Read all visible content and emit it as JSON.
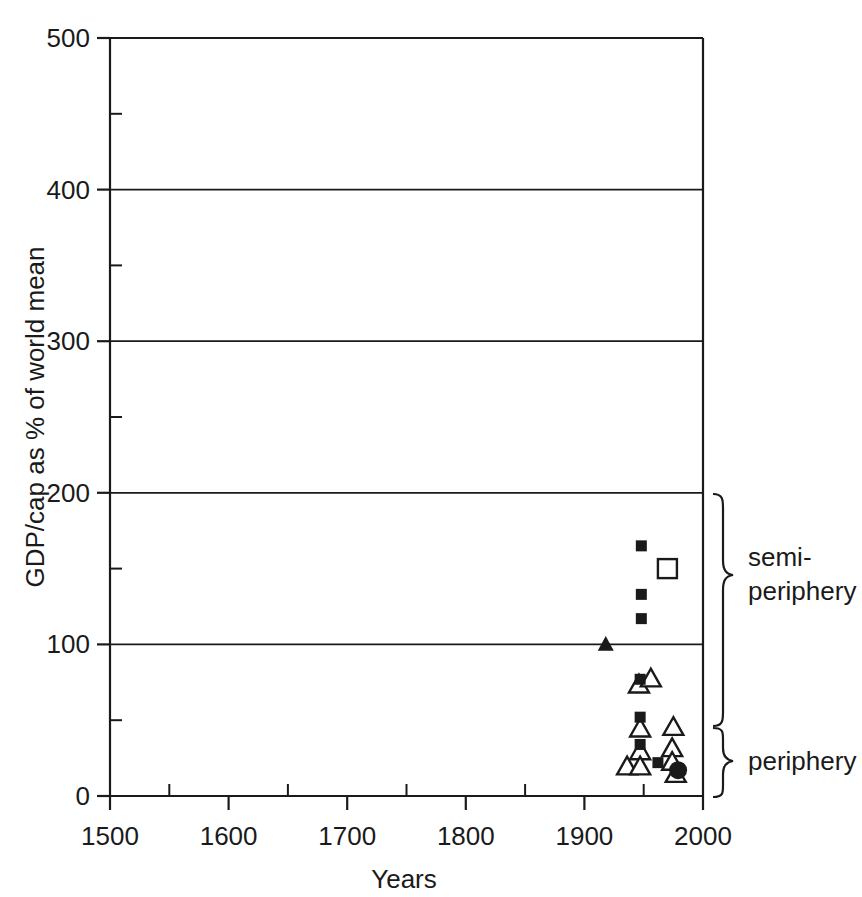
{
  "figure": {
    "background": "#ffffff",
    "ink_color": "#1a1a1a",
    "width": 862,
    "height": 897
  },
  "chart_data": {
    "type": "scatter",
    "title": "",
    "subtitle": "",
    "xlabel": "Years",
    "ylabel": "GDP/cap as % of world mean",
    "xlim": [
      1500,
      2000
    ],
    "ylim": [
      0,
      500
    ],
    "xticks": [
      1500,
      1600,
      1700,
      1800,
      1900,
      2000
    ],
    "xtick_labels": [
      "1500",
      "1600",
      "1700",
      "1800",
      "1900",
      "2000"
    ],
    "xminor_ticks": [
      1550,
      1650,
      1750,
      1850,
      1950
    ],
    "yticks": [
      0,
      100,
      200,
      300,
      400,
      500
    ],
    "ytick_labels": [
      "0",
      "100",
      "200",
      "300",
      "400",
      "500"
    ],
    "yminor_ticks": [
      50,
      150,
      250,
      350,
      450
    ],
    "grid": "horizontal-major",
    "gridlines_y": [
      100,
      200,
      300,
      400,
      500
    ],
    "legend": "none",
    "legend_position": "none",
    "series": [
      {
        "name": "filled-square",
        "marker": "filled-square",
        "fill": "#111111",
        "points": [
          {
            "x": 1948,
            "y": 165
          },
          {
            "x": 1948,
            "y": 133
          },
          {
            "x": 1948,
            "y": 117
          },
          {
            "x": 1947,
            "y": 77
          },
          {
            "x": 1947,
            "y": 52
          },
          {
            "x": 1947,
            "y": 34
          },
          {
            "x": 1962,
            "y": 22
          }
        ]
      },
      {
        "name": "open-square",
        "marker": "open-square",
        "fill": "none",
        "points": [
          {
            "x": 1970,
            "y": 150
          }
        ]
      },
      {
        "name": "filled-triangle",
        "marker": "filled-triangle",
        "fill": "#111111",
        "points": [
          {
            "x": 1918,
            "y": 100
          }
        ]
      },
      {
        "name": "open-triangle",
        "marker": "open-triangle",
        "fill": "none",
        "points": [
          {
            "x": 1946,
            "y": 73
          },
          {
            "x": 1956,
            "y": 77
          },
          {
            "x": 1947,
            "y": 44
          },
          {
            "x": 1975,
            "y": 45
          },
          {
            "x": 1947,
            "y": 29
          },
          {
            "x": 1974,
            "y": 31
          },
          {
            "x": 1936,
            "y": 19
          },
          {
            "x": 1947,
            "y": 19
          },
          {
            "x": 1974,
            "y": 22
          },
          {
            "x": 1977,
            "y": 14
          }
        ]
      },
      {
        "name": "filled-circle",
        "marker": "filled-circle",
        "fill": "#111111",
        "points": [
          {
            "x": 1979,
            "y": 17
          }
        ]
      }
    ],
    "annotations": [
      {
        "label": "semi-periphery",
        "brace_from": 50,
        "brace_to": 200
      },
      {
        "label": "periphery",
        "brace_from": 0,
        "brace_to": 50
      }
    ]
  },
  "labels": {
    "y_axis_title": "GDP/cap as % of world mean",
    "x_axis_title": "Years",
    "bracket_semi_line1": "semi-",
    "bracket_semi_line2": "periphery",
    "bracket_periphery": "periphery"
  }
}
